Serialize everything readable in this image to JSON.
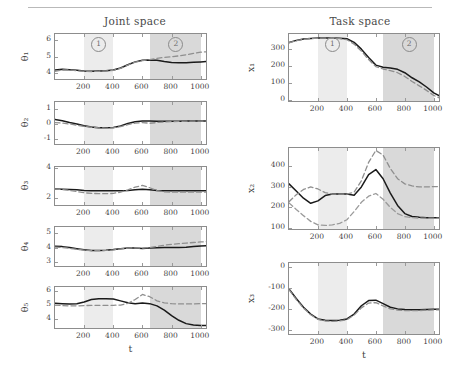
{
  "figure": {
    "columns": [
      {
        "id": "joint",
        "title": "Joint space"
      },
      {
        "id": "task",
        "title": "Task space"
      }
    ],
    "xlabel": "t",
    "region_markers": [
      {
        "label": "1",
        "t_center": 300
      },
      {
        "label": "2",
        "t_center": 830
      }
    ],
    "shading": {
      "region1_color": "#ececec",
      "region1_range": [
        200,
        400
      ],
      "region2_color": "#d9d9d9",
      "region2_range": [
        650,
        1000
      ]
    },
    "line_styles": {
      "measured_color": "#1a1a1a",
      "reference_color": "#8f8f8f"
    }
  },
  "chart_data": [
    {
      "type": "line",
      "title": "Joint space",
      "ylabel": "θ₁",
      "xlabel": "t",
      "xlim": [
        0,
        1050
      ],
      "ylim": [
        3.5,
        6.4
      ],
      "xticks": [
        200,
        400,
        600,
        800,
        1000
      ],
      "yticks": [
        4,
        5,
        6
      ],
      "grid": false,
      "series": [
        {
          "name": "solid",
          "x": [
            0,
            50,
            100,
            150,
            200,
            250,
            300,
            350,
            400,
            450,
            500,
            550,
            600,
            650,
            700,
            750,
            800,
            850,
            900,
            950,
            1000,
            1040
          ],
          "values": [
            4.18,
            4.22,
            4.2,
            4.16,
            4.12,
            4.1,
            4.12,
            4.14,
            4.18,
            4.3,
            4.5,
            4.68,
            4.78,
            4.8,
            4.78,
            4.7,
            4.64,
            4.62,
            4.62,
            4.65,
            4.68,
            4.7
          ]
        },
        {
          "name": "dashed",
          "x": [
            0,
            50,
            100,
            150,
            200,
            250,
            300,
            350,
            400,
            450,
            500,
            550,
            600,
            650,
            700,
            750,
            800,
            850,
            900,
            950,
            1000,
            1040
          ],
          "values": [
            4.1,
            4.18,
            4.18,
            4.14,
            4.1,
            4.08,
            4.1,
            4.12,
            4.16,
            4.28,
            4.48,
            4.66,
            4.76,
            4.82,
            4.9,
            4.96,
            5.0,
            5.05,
            5.12,
            5.2,
            5.28,
            5.3
          ]
        }
      ]
    },
    {
      "type": "line",
      "ylabel": "θ₂",
      "xlabel": "t",
      "xlim": [
        0,
        1050
      ],
      "ylim": [
        -1.5,
        1.5
      ],
      "xticks": [
        200,
        400,
        600,
        800,
        1000
      ],
      "yticks": [
        -1,
        0,
        1
      ],
      "grid": false,
      "series": [
        {
          "name": "solid",
          "x": [
            0,
            50,
            100,
            150,
            200,
            250,
            300,
            350,
            400,
            450,
            500,
            550,
            600,
            650,
            700,
            750,
            800,
            850,
            900,
            950,
            1000,
            1040
          ],
          "values": [
            0.3,
            0.22,
            0.1,
            0.0,
            -0.12,
            -0.2,
            -0.25,
            -0.26,
            -0.24,
            -0.14,
            0.04,
            0.16,
            0.2,
            0.2,
            0.19,
            0.18,
            0.18,
            0.19,
            0.2,
            0.2,
            0.2,
            0.2
          ]
        },
        {
          "name": "dashed",
          "x": [
            0,
            50,
            100,
            150,
            200,
            250,
            300,
            350,
            400,
            450,
            500,
            550,
            600,
            650,
            700,
            750,
            800,
            850,
            900,
            950,
            1000,
            1040
          ],
          "values": [
            0.1,
            0.06,
            0.0,
            -0.08,
            -0.16,
            -0.22,
            -0.26,
            -0.28,
            -0.26,
            -0.18,
            -0.05,
            0.06,
            0.1,
            0.05,
            0.1,
            0.14,
            0.16,
            0.18,
            0.19,
            0.2,
            0.2,
            0.2
          ]
        }
      ]
    },
    {
      "type": "line",
      "ylabel": "θ₃",
      "xlabel": "t",
      "xlim": [
        0,
        1050
      ],
      "ylim": [
        1.4,
        4.1
      ],
      "xticks": [
        200,
        400,
        600,
        800,
        1000
      ],
      "yticks": [
        2,
        4
      ],
      "grid": false,
      "series": [
        {
          "name": "solid",
          "x": [
            0,
            50,
            100,
            150,
            200,
            250,
            300,
            350,
            400,
            450,
            500,
            550,
            600,
            650,
            700,
            750,
            800,
            850,
            900,
            950,
            1000,
            1040
          ],
          "values": [
            2.62,
            2.6,
            2.58,
            2.56,
            2.52,
            2.5,
            2.5,
            2.5,
            2.5,
            2.5,
            2.52,
            2.56,
            2.6,
            2.56,
            2.52,
            2.5,
            2.5,
            2.5,
            2.5,
            2.5,
            2.5,
            2.5
          ]
        },
        {
          "name": "dashed",
          "x": [
            0,
            50,
            100,
            150,
            200,
            250,
            300,
            350,
            400,
            450,
            500,
            550,
            600,
            650,
            700,
            750,
            800,
            850,
            900,
            950,
            1000,
            1040
          ],
          "values": [
            2.6,
            2.58,
            2.52,
            2.44,
            2.36,
            2.32,
            2.3,
            2.3,
            2.32,
            2.4,
            2.56,
            2.74,
            2.86,
            2.7,
            2.5,
            2.42,
            2.4,
            2.4,
            2.4,
            2.4,
            2.4,
            2.4
          ]
        }
      ]
    },
    {
      "type": "line",
      "ylabel": "θ₄",
      "xlabel": "t",
      "xlim": [
        0,
        1050
      ],
      "ylim": [
        2.6,
        5.4
      ],
      "xticks": [
        200,
        400,
        600,
        800,
        1000
      ],
      "yticks": [
        3,
        4,
        5
      ],
      "grid": false,
      "series": [
        {
          "name": "solid",
          "x": [
            0,
            50,
            100,
            150,
            200,
            250,
            300,
            350,
            400,
            450,
            500,
            550,
            600,
            650,
            700,
            750,
            800,
            850,
            900,
            950,
            1000,
            1040
          ],
          "values": [
            4.08,
            4.06,
            4.0,
            3.92,
            3.84,
            3.8,
            3.8,
            3.82,
            3.86,
            3.92,
            3.96,
            3.96,
            3.94,
            3.96,
            3.98,
            4.0,
            4.0,
            4.0,
            4.02,
            4.06,
            4.1,
            4.12
          ]
        },
        {
          "name": "dashed",
          "x": [
            0,
            50,
            100,
            150,
            200,
            250,
            300,
            350,
            400,
            450,
            500,
            550,
            600,
            650,
            700,
            750,
            800,
            850,
            900,
            950,
            1000,
            1040
          ],
          "values": [
            4.02,
            4.0,
            3.94,
            3.88,
            3.82,
            3.78,
            3.78,
            3.8,
            3.84,
            3.9,
            3.96,
            3.98,
            3.96,
            4.0,
            4.08,
            4.16,
            4.22,
            4.26,
            4.3,
            4.34,
            4.38,
            4.4
          ]
        }
      ]
    },
    {
      "type": "line",
      "ylabel": "θ₅",
      "xlabel": "t",
      "xlim": [
        0,
        1050
      ],
      "ylim": [
        3.2,
        6.3
      ],
      "xticks": [
        200,
        400,
        600,
        800,
        1000
      ],
      "yticks": [
        4,
        5,
        6
      ],
      "grid": false,
      "series": [
        {
          "name": "solid",
          "x": [
            0,
            50,
            100,
            150,
            200,
            250,
            300,
            350,
            400,
            450,
            500,
            550,
            600,
            650,
            700,
            750,
            800,
            850,
            900,
            950,
            1000,
            1040
          ],
          "values": [
            5.12,
            5.1,
            5.08,
            5.1,
            5.22,
            5.4,
            5.46,
            5.46,
            5.44,
            5.3,
            5.16,
            5.1,
            5.14,
            5.1,
            4.94,
            4.64,
            4.24,
            3.9,
            3.66,
            3.56,
            3.52,
            3.52
          ]
        },
        {
          "name": "dashed",
          "x": [
            0,
            50,
            100,
            150,
            200,
            250,
            300,
            350,
            400,
            450,
            500,
            550,
            600,
            650,
            700,
            750,
            800,
            850,
            900,
            950,
            1000,
            1040
          ],
          "values": [
            5.0,
            4.96,
            4.94,
            4.94,
            4.96,
            4.98,
            4.98,
            4.98,
            4.98,
            5.0,
            5.12,
            5.4,
            5.76,
            5.6,
            5.3,
            5.16,
            5.1,
            5.08,
            5.08,
            5.08,
            5.1,
            5.1
          ]
        }
      ]
    },
    {
      "type": "line",
      "title": "Task space",
      "ylabel": "x₁",
      "xlabel": "t",
      "xlim": [
        0,
        1050
      ],
      "ylim": [
        -20,
        390
      ],
      "xticks": [
        200,
        400,
        600,
        800,
        1000
      ],
      "yticks": [
        0,
        100,
        200,
        300
      ],
      "grid": false,
      "series": [
        {
          "name": "solid",
          "x": [
            0,
            50,
            100,
            150,
            200,
            250,
            300,
            350,
            400,
            450,
            500,
            550,
            600,
            650,
            700,
            750,
            800,
            850,
            900,
            950,
            1000,
            1040
          ],
          "values": [
            340,
            352,
            360,
            364,
            366,
            366,
            366,
            365,
            362,
            340,
            300,
            250,
            205,
            192,
            188,
            180,
            160,
            130,
            105,
            75,
            40,
            22
          ]
        },
        {
          "name": "dashed",
          "x": [
            0,
            50,
            100,
            150,
            200,
            250,
            300,
            350,
            400,
            450,
            500,
            550,
            600,
            650,
            700,
            750,
            800,
            850,
            900,
            950,
            1000,
            1040
          ],
          "values": [
            338,
            350,
            358,
            363,
            365,
            365,
            364,
            362,
            356,
            330,
            288,
            238,
            196,
            182,
            172,
            160,
            138,
            108,
            82,
            55,
            25,
            10
          ]
        }
      ]
    },
    {
      "type": "line",
      "ylabel": "x₂",
      "xlabel": "t",
      "xlim": [
        0,
        1050
      ],
      "ylim": [
        85,
        490
      ],
      "xticks": [
        200,
        400,
        600,
        800,
        1000
      ],
      "yticks": [
        100,
        200,
        300,
        400
      ],
      "grid": false,
      "series": [
        {
          "name": "solid",
          "x": [
            0,
            50,
            100,
            150,
            200,
            250,
            300,
            350,
            400,
            450,
            500,
            550,
            600,
            650,
            700,
            750,
            800,
            850,
            900,
            950,
            1000,
            1040
          ],
          "values": [
            315,
            280,
            245,
            220,
            232,
            258,
            265,
            265,
            265,
            260,
            300,
            360,
            385,
            340,
            270,
            210,
            170,
            156,
            152,
            150,
            150,
            150
          ]
        },
        {
          "name": "dashed-upper",
          "x": [
            0,
            50,
            100,
            150,
            200,
            250,
            300,
            350,
            400,
            450,
            500,
            550,
            600,
            650,
            700,
            750,
            800,
            850,
            900,
            950,
            1000,
            1040
          ],
          "values": [
            228,
            262,
            288,
            300,
            290,
            272,
            265,
            265,
            265,
            275,
            330,
            420,
            478,
            455,
            390,
            340,
            315,
            305,
            300,
            300,
            302,
            302
          ]
        },
        {
          "name": "dashed-lower",
          "x": [
            0,
            50,
            100,
            150,
            200,
            250,
            300,
            350,
            400,
            450,
            500,
            550,
            600,
            650,
            700,
            750,
            800,
            850,
            900,
            950,
            1000,
            1040
          ],
          "values": [
            222,
            190,
            160,
            132,
            115,
            112,
            115,
            122,
            140,
            180,
            225,
            255,
            268,
            240,
            200,
            170,
            155,
            150,
            148,
            148,
            148,
            148
          ]
        }
      ]
    },
    {
      "type": "line",
      "ylabel": "x₃",
      "xlabel": "t",
      "xlim": [
        0,
        1050
      ],
      "ylim": [
        -330,
        20
      ],
      "xticks": [
        200,
        400,
        600,
        800,
        1000
      ],
      "yticks": [
        0,
        -100,
        -200,
        -300
      ],
      "grid": false,
      "series": [
        {
          "name": "solid",
          "x": [
            0,
            50,
            100,
            150,
            200,
            250,
            300,
            350,
            400,
            450,
            500,
            550,
            600,
            650,
            700,
            750,
            800,
            850,
            900,
            950,
            1000,
            1040
          ],
          "values": [
            -105,
            -150,
            -192,
            -225,
            -248,
            -255,
            -256,
            -254,
            -248,
            -225,
            -185,
            -160,
            -158,
            -175,
            -192,
            -200,
            -203,
            -204,
            -204,
            -203,
            -202,
            -202
          ]
        },
        {
          "name": "dashed",
          "x": [
            0,
            50,
            100,
            150,
            200,
            250,
            300,
            350,
            400,
            450,
            500,
            550,
            600,
            650,
            700,
            750,
            800,
            850,
            900,
            950,
            1000,
            1040
          ],
          "values": [
            -108,
            -155,
            -196,
            -228,
            -250,
            -258,
            -260,
            -258,
            -252,
            -230,
            -195,
            -172,
            -170,
            -186,
            -200,
            -206,
            -208,
            -208,
            -208,
            -206,
            -205,
            -205
          ]
        }
      ]
    }
  ]
}
